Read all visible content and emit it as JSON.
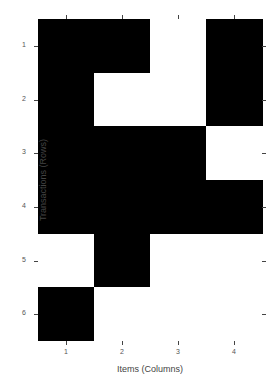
{
  "chart_data": {
    "type": "heatmap",
    "title": "",
    "xlabel": "Items (Columns)",
    "ylabel": "Transactions (Rows)",
    "x_ticks": [
      "1",
      "2",
      "3",
      "4"
    ],
    "y_ticks": [
      "1",
      "2",
      "3",
      "4",
      "5",
      "6"
    ],
    "colors": {
      "present": "#000000",
      "absent": "#ffffff"
    },
    "matrix": [
      [
        1,
        1,
        0,
        1
      ],
      [
        1,
        0,
        0,
        1
      ],
      [
        1,
        1,
        1,
        0
      ],
      [
        1,
        1,
        1,
        1
      ],
      [
        0,
        1,
        0,
        0
      ],
      [
        1,
        0,
        0,
        0
      ]
    ]
  }
}
